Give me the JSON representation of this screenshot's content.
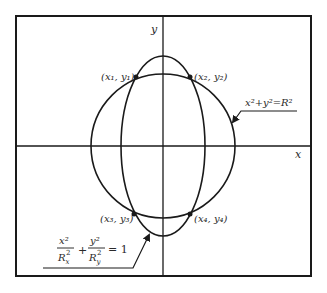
{
  "diagram": {
    "axes": {
      "x_label": "x",
      "y_label": "y"
    },
    "curves": {
      "circle": {
        "label": "x²+y²=R²",
        "equation": "x^2+y^2=R^2"
      },
      "ellipse": {
        "equation": "x^2/R_x^2 + y^2/R_y^2 = 1",
        "num1": "x²",
        "den1": "R",
        "den1_sub": "x",
        "den1_sup": "2",
        "plus": "+",
        "num2": "y²",
        "den2": "R",
        "den2_sub": "y",
        "den2_sup": "2",
        "equals": "= 1"
      }
    },
    "intersections": [
      {
        "label": "(x₁, y₁)"
      },
      {
        "label": "(x₂, y₂)"
      },
      {
        "label": "(x₃, y₃)"
      },
      {
        "label": "(x₄, y₄)"
      }
    ],
    "colors": {
      "stroke": "#1a1a1a",
      "background": "#ffffff"
    }
  }
}
